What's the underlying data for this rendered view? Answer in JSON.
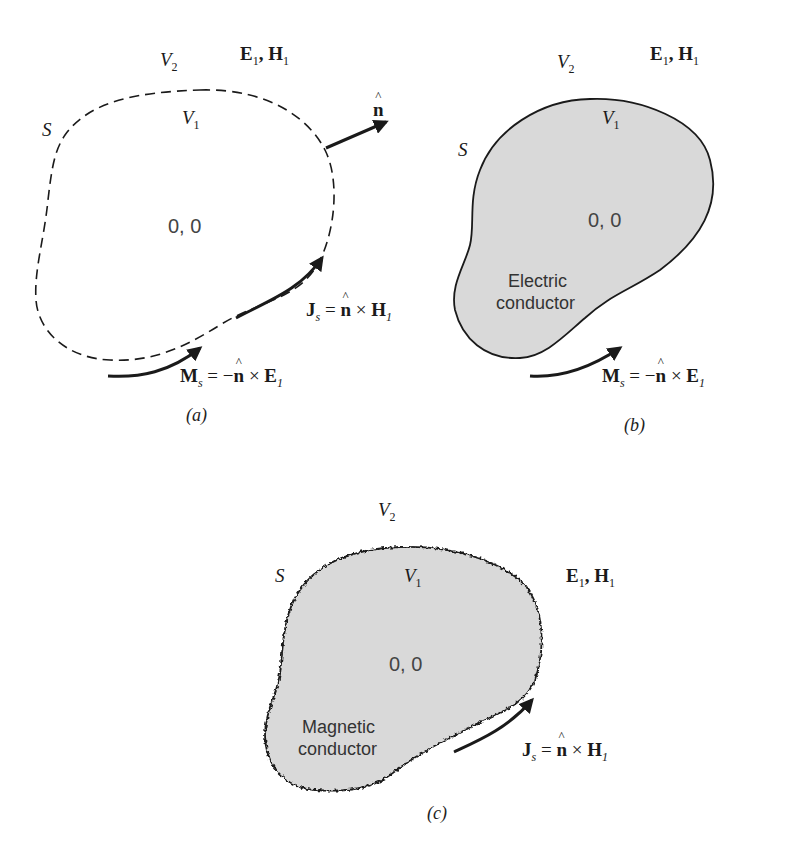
{
  "colors": {
    "ink": "#1a1a1a",
    "conductor_fill": "#d9d9d9",
    "text_gray": "#444444"
  },
  "panels": [
    {
      "id": "a",
      "caption": "(a)",
      "surface_label": "S",
      "outer_region": "V",
      "outer_region_sub": "2",
      "inner_region": "V",
      "inner_region_sub": "1",
      "fields_main": "E",
      "fields_sub1": "1",
      "fields_sep": ", ",
      "fields_main2": "H",
      "fields_sub2": "1",
      "interior_fields": "0, 0",
      "normal_label": "n",
      "boundary_style": "dashed",
      "js_eq": {
        "lhs": "J",
        "lhs_sub": "s",
        "op": " = ",
        "n": "n",
        "cross": " × ",
        "rhs": "H",
        "rhs_sub": "1"
      },
      "ms_eq": {
        "lhs": "M",
        "lhs_sub": "s",
        "op": " = −",
        "n": "n",
        "cross": " × ",
        "rhs": "E",
        "rhs_sub": "1"
      }
    },
    {
      "id": "b",
      "caption": "(b)",
      "surface_label": "S",
      "outer_region": "V",
      "outer_region_sub": "2",
      "inner_region": "V",
      "inner_region_sub": "1",
      "fields_main": "E",
      "fields_sub1": "1",
      "fields_sep": ", ",
      "fields_main2": "H",
      "fields_sub2": "1",
      "interior_fields": "0, 0",
      "material_line1": "Electric",
      "material_line2": "conductor",
      "boundary_style": "solid",
      "ms_eq": {
        "lhs": "M",
        "lhs_sub": "s",
        "op": " = −",
        "n": "n",
        "cross": " × ",
        "rhs": "E",
        "rhs_sub": "1"
      }
    },
    {
      "id": "c",
      "caption": "(c)",
      "surface_label": "S",
      "outer_region": "V",
      "outer_region_sub": "2",
      "inner_region": "V",
      "inner_region_sub": "1",
      "fields_main": "E",
      "fields_sub1": "1",
      "fields_sep": ", ",
      "fields_main2": "H",
      "fields_sub2": "1",
      "interior_fields": "0, 0",
      "material_line1": "Magnetic",
      "material_line2": "conductor",
      "boundary_style": "wavy",
      "js_eq": {
        "lhs": "J",
        "lhs_sub": "s",
        "op": " = ",
        "n": "n",
        "cross": " × ",
        "rhs": "H",
        "rhs_sub": "1"
      }
    }
  ]
}
